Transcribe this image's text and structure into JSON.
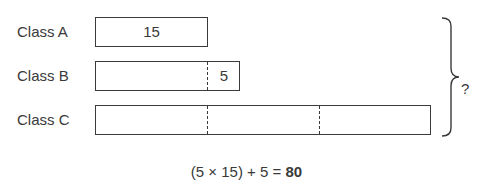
{
  "rows": [
    {
      "label": "Class A",
      "value": "15"
    },
    {
      "label": "Class B",
      "value": "5"
    },
    {
      "label": "Class C",
      "value": ""
    }
  ],
  "brace_label": "?",
  "equation": {
    "expression": "(5 × 15) + 5 = ",
    "result": "80"
  },
  "colors": {
    "stroke": "#3a3a3a",
    "background": "#ffffff"
  }
}
